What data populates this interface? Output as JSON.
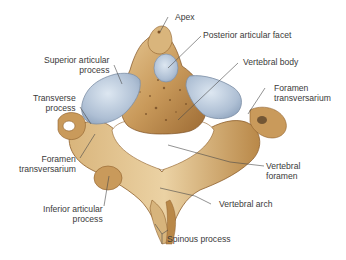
{
  "figure": {
    "colors": {
      "bone": "#c99a5b",
      "bone_light": "#e3c38f",
      "bone_dark": "#8e5f2c",
      "cartilage": "#a9bdd3",
      "cartilage_light": "#d4e0ec",
      "leader": "#4a4a4a",
      "text": "#3a3a3a"
    }
  },
  "labels": {
    "apex": "Apex",
    "posterior_articular_facet": "Posterior articular facet",
    "superior_articular_process_1": "Superior articular",
    "superior_articular_process_2": "process",
    "vertebral_body": "Vertebral body",
    "transverse_process_1": "Transverse",
    "transverse_process_2": "process",
    "foramen_transversarium_right_1": "Foramen",
    "foramen_transversarium_right_2": "transversarium",
    "foramen_transversarium_left_1": "Foramen",
    "foramen_transversarium_left_2": "transversarium",
    "vertebral_foramen_1": "Vertebral",
    "vertebral_foramen_2": "foramen",
    "inferior_articular_process_1": "Inferior articular",
    "inferior_articular_process_2": "process",
    "vertebral_arch": "Vertebral arch",
    "spinous_process": "Spinous process"
  }
}
